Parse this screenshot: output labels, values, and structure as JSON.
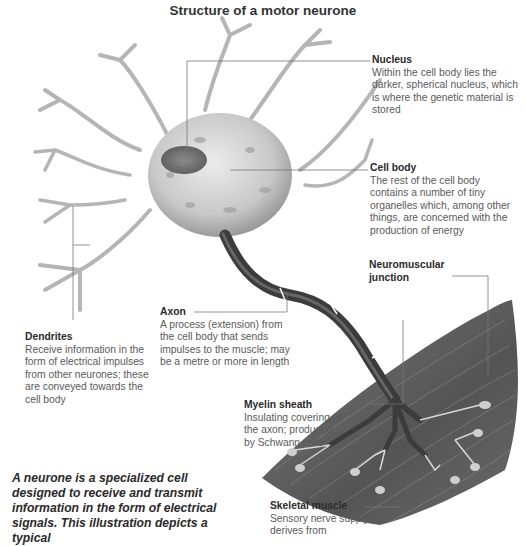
{
  "title": "Structure of a motor neurone",
  "labels": {
    "nucleus": {
      "heading": "Nucleus",
      "text": "Within the cell body lies the darker, spherical nucleus, which is where the genetic material is stored"
    },
    "cell_body": {
      "heading": "Cell body",
      "text": "The rest of the cell body contains a number of tiny organelles which, among other things, are concerned with the production of energy"
    },
    "neuromuscular_junction": {
      "heading": "Neuromuscular junction",
      "text": ""
    },
    "dendrites": {
      "heading": "Dendrites",
      "text": "Receive information in the form of electrical impulses from other neurones; these are conveyed towards the cell body"
    },
    "axon": {
      "heading": "Axon",
      "text": "A process (extension) from the cell body that sends impulses to the muscle; may be a metre or more in length"
    },
    "myelin_sheath": {
      "heading": "Myelin sheath",
      "text": "Insulating covering of the axon; produced by Schwann cells"
    },
    "skeletal_muscle": {
      "heading": "Skeletal muscle",
      "text": "Sensory nerve supply derives from"
    }
  },
  "caption": "A neurone is a specialized cell designed to receive and transmit information in the form of electrical signals. This illustration depicts a typical",
  "colors": {
    "background": "#ffffff",
    "heading_text": "#2a2a2a",
    "body_text": "#5a5a5a",
    "leader_line": "#777777",
    "muscle": "#5e5e5e",
    "axon": "#3c3c3c",
    "cell_body": "#cfcfcf"
  }
}
